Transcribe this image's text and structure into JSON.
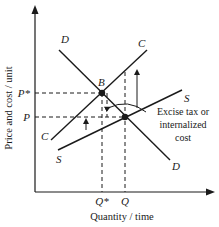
{
  "diagram": {
    "axes": {
      "y_label": "Price and cost / unit",
      "x_label": "Quantity / time"
    },
    "y_ticks": [
      {
        "label": "P*",
        "y": 93
      },
      {
        "label": "P",
        "y": 117
      }
    ],
    "x_ticks": [
      {
        "label": "Q*",
        "x": 102
      },
      {
        "label": "Q",
        "x": 125
      }
    ],
    "curves": [
      {
        "name": "D",
        "kind": "demand",
        "top_label": "D",
        "bottom_label": "D"
      },
      {
        "name": "S",
        "kind": "supply",
        "top_label": "S",
        "bottom_label": "S"
      },
      {
        "name": "C",
        "kind": "social-cost",
        "top_label": "C",
        "bottom_label": "C"
      }
    ],
    "points": [
      {
        "label": "B",
        "x": 102,
        "y": 93
      }
    ],
    "annotation": {
      "line1": "Excise tax or",
      "line2": "internalized",
      "line3": "cost"
    },
    "colors": {
      "ink": "#1a1a1a",
      "background": "#ffffff"
    }
  }
}
